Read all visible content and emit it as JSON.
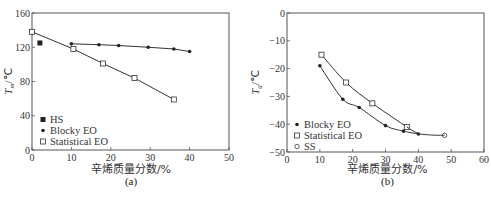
{
  "chart_data": [
    {
      "type": "line",
      "panel": "(a)",
      "title": "",
      "xlabel": "辛烯质量分数/%",
      "ylabel": "Tm/℃",
      "xlim": [
        0,
        50
      ],
      "ylim": [
        0,
        160
      ],
      "xticks": [
        0,
        10,
        20,
        30,
        40,
        50
      ],
      "yticks": [
        0,
        40,
        80,
        120,
        160
      ],
      "grid": false,
      "legend_position": "lower-left",
      "legend": [
        "HS",
        "Blocky EO",
        "Statistical EO"
      ],
      "series": [
        {
          "name": "HS",
          "marker": "filled-square",
          "points": [
            [
              2,
              125
            ]
          ]
        },
        {
          "name": "Blocky EO",
          "marker": "filled-circle",
          "points": [
            [
              10,
              124
            ],
            [
              17,
              123
            ],
            [
              22,
              122
            ],
            [
              29.5,
              120
            ],
            [
              36,
              118
            ],
            [
              40,
              115
            ]
          ]
        },
        {
          "name": "Statistical EO",
          "marker": "open-square",
          "points": [
            [
              0,
              138
            ],
            [
              10.5,
              118
            ],
            [
              18,
              101
            ],
            [
              26,
              84
            ],
            [
              36,
              59
            ]
          ]
        }
      ],
      "caption": "(a)"
    },
    {
      "type": "line",
      "panel": "(b)",
      "title": "",
      "xlabel": "辛烯质量分数/%",
      "ylabel": "Tg/℃",
      "xlim": [
        0,
        60
      ],
      "ylim": [
        -50,
        0
      ],
      "xticks": [
        0,
        10,
        20,
        30,
        40,
        50,
        60
      ],
      "yticks": [
        0,
        -10,
        -20,
        -30,
        -40,
        -50
      ],
      "grid": false,
      "legend_position": "lower-left",
      "legend": [
        "Blocky EO",
        "Statistical EO",
        "SS"
      ],
      "series": [
        {
          "name": "Blocky EO",
          "marker": "filled-circle",
          "points": [
            [
              10,
              -19
            ],
            [
              17,
              -31
            ],
            [
              22,
              -34
            ],
            [
              30,
              -40.5
            ],
            [
              35.5,
              -42.5
            ],
            [
              40,
              -43.5
            ]
          ]
        },
        {
          "name": "Statistical EO",
          "marker": "open-square",
          "points": [
            [
              10.5,
              -15
            ],
            [
              18,
              -25
            ],
            [
              26,
              -32.5
            ],
            [
              36.5,
              -41
            ]
          ]
        },
        {
          "name": "SS",
          "marker": "open-circle",
          "points": [
            [
              48,
              -44
            ]
          ]
        }
      ],
      "caption": "(b)"
    }
  ],
  "labels": {
    "a": {
      "xlabel": "辛烯质量分数/%",
      "ylabel_main": "T",
      "ylabel_sub": "m",
      "ylabel_unit": "/℃",
      "caption": "(a)",
      "legend": [
        "HS",
        "Blocky EO",
        "Statistical EO"
      ],
      "xticks": [
        "0",
        "10",
        "20",
        "30",
        "40",
        "50"
      ],
      "yticks": [
        "0",
        "40",
        "80",
        "120",
        "160"
      ]
    },
    "b": {
      "xlabel": "辛烯质量分数/%",
      "ylabel_main": "T",
      "ylabel_sub": "g",
      "ylabel_unit": "/℃",
      "caption": "(b)",
      "legend": [
        "Blocky EO",
        "Statistical EO",
        "SS"
      ],
      "xticks": [
        "0",
        "10",
        "20",
        "30",
        "40",
        "50",
        "60"
      ],
      "yticks": [
        "0",
        "-10",
        "-20",
        "-30",
        "-40",
        "-50"
      ]
    }
  },
  "colors": {
    "axis": "#555555",
    "line": "#333333",
    "marker": "#222222",
    "background": "#ffffff"
  }
}
